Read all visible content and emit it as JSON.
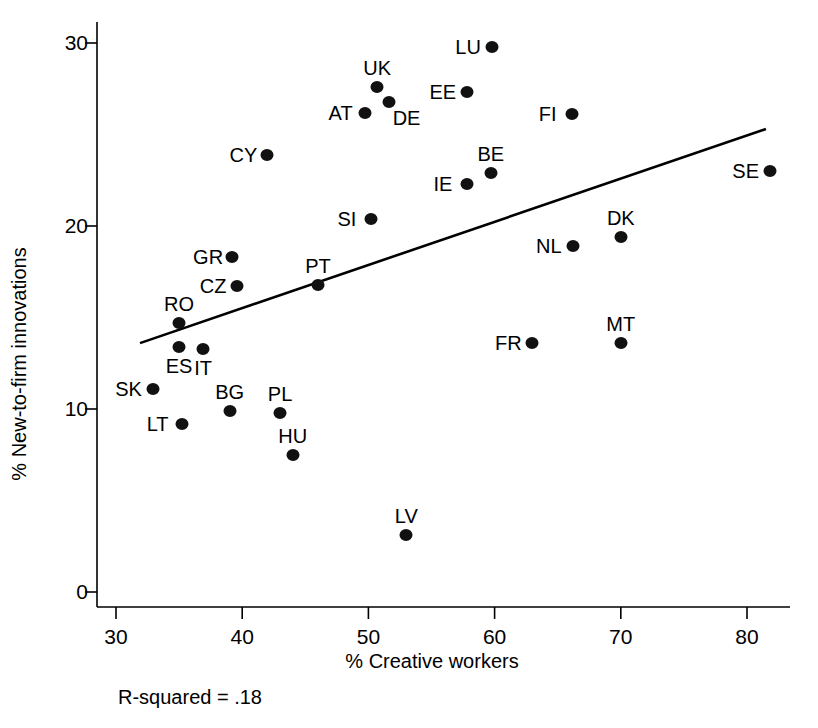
{
  "figure": {
    "r_squared_text": "R-squared = .18"
  },
  "chart_data": {
    "type": "scatter",
    "title": "",
    "xlabel": "% Creative workers",
    "ylabel": "% New-to-firm innovations",
    "xlim": [
      28,
      85
    ],
    "ylim": [
      0,
      31
    ],
    "xticks": [
      30,
      40,
      50,
      60,
      70,
      80
    ],
    "xtick_labels": [
      "30",
      "40",
      "50",
      "60",
      "70",
      "80"
    ],
    "yticks": [
      0,
      10,
      20,
      30
    ],
    "ytick_labels": [
      "0",
      "10",
      "20",
      "30"
    ],
    "grid": false,
    "legend": null,
    "annotations": [
      "R-squared = .18"
    ],
    "r_squared": 0.18,
    "trendline": {
      "type": "linear",
      "x_start": 31.9,
      "y_start": 13.6,
      "x_end": 81.5,
      "y_end": 25.3
    },
    "point_label_field": "label",
    "points": [
      {
        "label": "SK",
        "x": 32.9,
        "y": 11.1,
        "label_pos": "left"
      },
      {
        "label": "LT",
        "x": 35.2,
        "y": 9.2,
        "label_pos": "left"
      },
      {
        "label": "ES",
        "x": 35.0,
        "y": 13.4,
        "label_pos": "below"
      },
      {
        "label": "RO",
        "x": 35.0,
        "y": 14.7,
        "label_pos": "above"
      },
      {
        "label": "IT",
        "x": 36.9,
        "y": 13.3,
        "label_pos": "below"
      },
      {
        "label": "BG",
        "x": 39.0,
        "y": 9.9,
        "label_pos": "above"
      },
      {
        "label": "GR",
        "x": 39.2,
        "y": 18.3,
        "label_pos": "left"
      },
      {
        "label": "CZ",
        "x": 39.6,
        "y": 16.7,
        "label_pos": "left"
      },
      {
        "label": "CY",
        "x": 42.0,
        "y": 23.9,
        "label_pos": "left"
      },
      {
        "label": "PL",
        "x": 43.0,
        "y": 9.8,
        "label_pos": "above"
      },
      {
        "label": "HU",
        "x": 44.0,
        "y": 7.5,
        "label_pos": "above"
      },
      {
        "label": "PT",
        "x": 46.0,
        "y": 16.8,
        "label_pos": "above"
      },
      {
        "label": "AT",
        "x": 49.7,
        "y": 26.2,
        "label_pos": "left"
      },
      {
        "label": "SI",
        "x": 50.2,
        "y": 20.4,
        "label_pos": "left"
      },
      {
        "label": "UK",
        "x": 50.7,
        "y": 27.6,
        "label_pos": "above"
      },
      {
        "label": "DE",
        "x": 51.6,
        "y": 26.8,
        "label_pos": "below-right"
      },
      {
        "label": "LV",
        "x": 53.0,
        "y": 3.1,
        "label_pos": "above"
      },
      {
        "label": "IE",
        "x": 57.8,
        "y": 22.3,
        "label_pos": "left"
      },
      {
        "label": "EE",
        "x": 57.8,
        "y": 27.3,
        "label_pos": "left"
      },
      {
        "label": "BE",
        "x": 59.7,
        "y": 22.9,
        "label_pos": "above"
      },
      {
        "label": "LU",
        "x": 59.8,
        "y": 29.8,
        "label_pos": "left"
      },
      {
        "label": "FR",
        "x": 63.0,
        "y": 13.6,
        "label_pos": "left"
      },
      {
        "label": "NL",
        "x": 66.2,
        "y": 18.9,
        "label_pos": "left"
      },
      {
        "label": "FI",
        "x": 66.1,
        "y": 26.1,
        "label_pos": "left"
      },
      {
        "label": "DK",
        "x": 70.0,
        "y": 19.4,
        "label_pos": "above"
      },
      {
        "label": "MT",
        "x": 70.0,
        "y": 13.6,
        "label_pos": "above"
      },
      {
        "label": "SE",
        "x": 81.8,
        "y": 23.0,
        "label_pos": "left"
      }
    ]
  }
}
